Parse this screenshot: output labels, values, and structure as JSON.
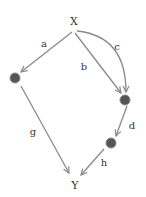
{
  "diagram": {
    "nodes": {
      "x": {
        "label": "X"
      },
      "y": {
        "label": "Y"
      },
      "m1": {
        "label": ""
      },
      "m2": {
        "label": ""
      },
      "m3": {
        "label": ""
      }
    },
    "edges": [
      {
        "id": "a",
        "label": "a",
        "from": "X",
        "to": "M1"
      },
      {
        "id": "b",
        "label": "b",
        "from": "X",
        "to": "M2"
      },
      {
        "id": "c",
        "label": "c",
        "from": "X",
        "to": "M2",
        "curved": true
      },
      {
        "id": "d",
        "label": "d",
        "from": "M2",
        "to": "M3"
      },
      {
        "id": "g",
        "label": "g",
        "from": "M1",
        "to": "Y"
      },
      {
        "id": "h",
        "label": "h",
        "from": "M3",
        "to": "Y",
        "dashed_start": true
      }
    ],
    "colors": {
      "edge": "#8a8a8a",
      "node_fill": "#555555",
      "node_stroke": "#8a8a8a",
      "text": "#333333"
    }
  }
}
